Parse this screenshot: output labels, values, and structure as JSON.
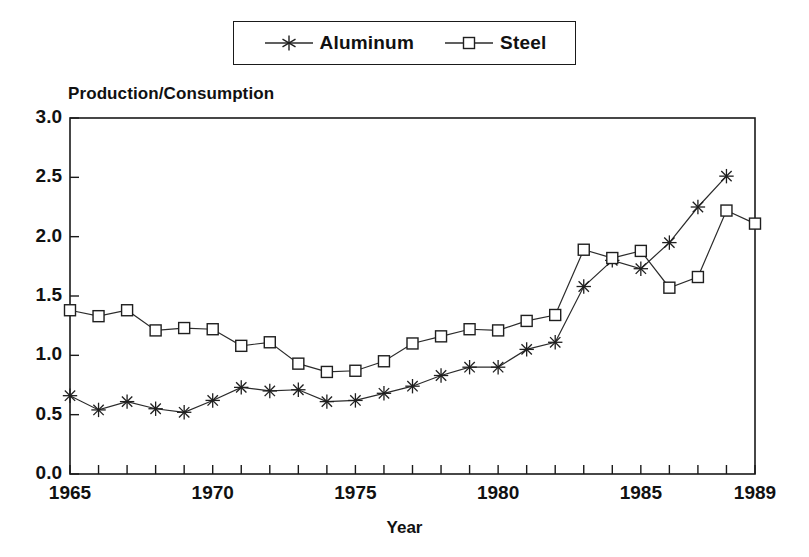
{
  "chart_data": {
    "type": "line",
    "title": "",
    "xlabel": "Year",
    "ylabel": "Production/Consumption",
    "xlim": [
      1965,
      1989
    ],
    "ylim": [
      0.0,
      3.0
    ],
    "grid": false,
    "legend_position": "top-center",
    "x": [
      1965,
      1966,
      1967,
      1968,
      1969,
      1970,
      1971,
      1972,
      1973,
      1974,
      1975,
      1976,
      1977,
      1978,
      1979,
      1980,
      1981,
      1982,
      1983,
      1984,
      1985,
      1986,
      1987,
      1988,
      1989
    ],
    "xtick_labels": [
      "1965",
      "1970",
      "1975",
      "1980",
      "1985",
      "1989"
    ],
    "xtick_values": [
      1965,
      1970,
      1975,
      1980,
      1985,
      1989
    ],
    "ytick_labels": [
      "0.0",
      "0.5",
      "1.0",
      "1.5",
      "2.0",
      "2.5",
      "3.0"
    ],
    "ytick_values": [
      0.0,
      0.5,
      1.0,
      1.5,
      2.0,
      2.5,
      3.0
    ],
    "series": [
      {
        "name": "Aluminum",
        "marker": "asterisk",
        "values": [
          0.66,
          0.54,
          0.61,
          0.55,
          0.52,
          0.62,
          0.73,
          0.7,
          0.71,
          0.61,
          0.62,
          0.68,
          0.74,
          0.83,
          0.9,
          0.9,
          1.05,
          1.11,
          1.58,
          1.8,
          1.73,
          1.95,
          2.25,
          2.51,
          null
        ]
      },
      {
        "name": "Steel",
        "marker": "square",
        "values": [
          1.38,
          1.33,
          1.38,
          1.21,
          1.23,
          1.22,
          1.08,
          1.11,
          0.93,
          0.86,
          0.87,
          0.95,
          1.1,
          1.16,
          1.22,
          1.21,
          1.29,
          1.34,
          1.89,
          1.82,
          1.88,
          1.57,
          1.66,
          2.22,
          2.11
        ]
      }
    ]
  },
  "legend": {
    "entries": [
      {
        "label": "Aluminum",
        "marker": "asterisk-marker-icon"
      },
      {
        "label": "Steel",
        "marker": "square-marker-icon"
      }
    ]
  },
  "axes": {
    "y_axis_title": "Production/Consumption",
    "x_axis_title": "Year"
  },
  "colors": {
    "line": "#2b2b2b",
    "frame": "#1a1a1a",
    "background": "#ffffff",
    "text": "#111111"
  }
}
